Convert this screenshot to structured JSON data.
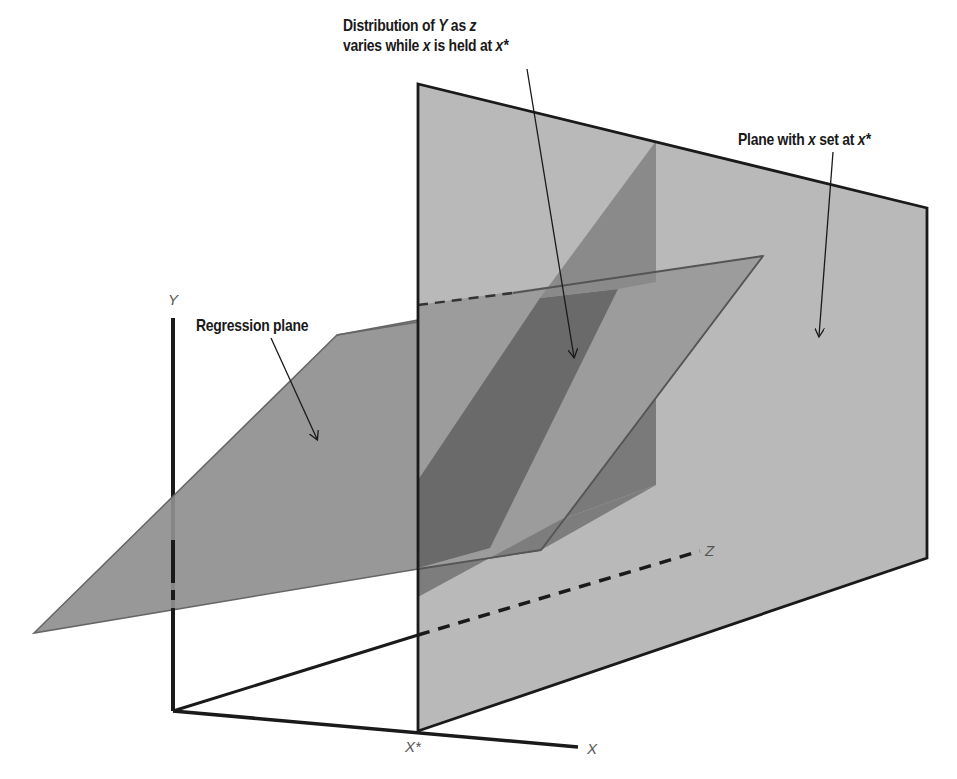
{
  "title_label": {
    "line1_prefix": "Distribution of ",
    "line1_var_y": "Y",
    "line1_mid": " as ",
    "line1_var_z": "z",
    "line2_prefix": "varies while ",
    "line2_var_x": "x",
    "line2_mid": " is held at ",
    "line2_var_xstar": "x*"
  },
  "plane_label": {
    "prefix": "Plane with ",
    "var_x": "x",
    "mid": " set at ",
    "var_xstar": "x*"
  },
  "regression_label": "Regression plane",
  "axes": {
    "y": "Y",
    "x": "X",
    "z": "Z",
    "xstar": "X*"
  },
  "colors": {
    "vertical_plane": "#b9b9b9",
    "regression_plane": "#8f8f8f",
    "intersection_band": "#6a6a6a",
    "lower_wedge": "#7d7d7d",
    "axis_line": "#1a1a1a",
    "background": "#ffffff"
  }
}
